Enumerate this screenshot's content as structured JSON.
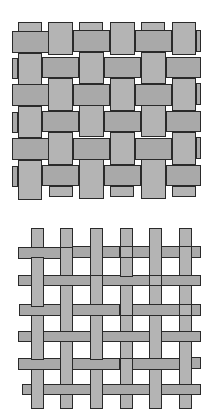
{
  "figure": {
    "title": "",
    "panels": [
      {
        "name": "basket-weave",
        "description": "Dense 2x2 basket weave pattern, wide strips",
        "fill_warp": "#b4b4b4",
        "fill_weft": "#a9a9a9",
        "border": "#2a2a2a"
      },
      {
        "name": "plain-weave-open",
        "description": "Open plain weave grid with narrow strips",
        "fill_warp": "#b4b4b4",
        "fill_weft": "#a9a9a9",
        "border": "#2a2a2a"
      }
    ]
  }
}
